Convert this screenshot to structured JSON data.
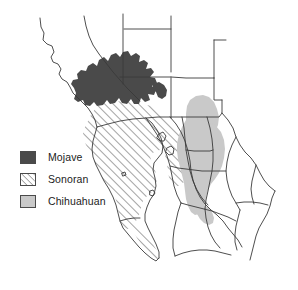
{
  "figure": {
    "type": "thematic-map",
    "title": "",
    "background_color": "#ffffff",
    "outline_color": "#3a3a3a",
    "width": 298,
    "height": 290
  },
  "legend": {
    "position": "lower-left",
    "items": [
      {
        "id": "mojave",
        "label": "Mojave",
        "fill_style": "solid",
        "color": "#4a4a4a",
        "border_color": "#4a4a4a"
      },
      {
        "id": "sonoran",
        "label": "Sonoran",
        "fill_style": "diagonal-hatch",
        "color": "#ffffff",
        "hatch_color": "#4a4a4a",
        "border_color": "#4a4a4a"
      },
      {
        "id": "chihuahuan",
        "label": "Chihuahuan",
        "fill_style": "solid",
        "color": "#c9c9c9",
        "border_color": "#4a4a4a"
      }
    ]
  },
  "map": {
    "boundaries_description": "Political boundaries of the southwestern United States and northern Mexico, including the Baja California peninsula and the Gulf of California",
    "regions": [
      {
        "id": "mojave",
        "label": "Mojave",
        "fill_style": "solid",
        "color": "#4a4a4a",
        "approx_location": "southeastern California and southern Nevada"
      },
      {
        "id": "sonoran",
        "label": "Sonoran",
        "fill_style": "diagonal-hatch",
        "color": "#ffffff",
        "hatch_color": "#4a4a4a",
        "approx_location": "southern Arizona, Baja California peninsula and coastal Sonora"
      },
      {
        "id": "chihuahuan",
        "label": "Chihuahuan",
        "fill_style": "solid",
        "color": "#c9c9c9",
        "approx_location": "southern New Mexico, west Texas and the central Mexican plateau"
      }
    ]
  }
}
